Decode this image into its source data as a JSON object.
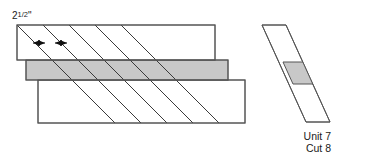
{
  "diagram": {
    "background_color": "#ffffff",
    "line_color": "#555555",
    "cut_line_color": "#3a3a3a",
    "fabric_gray": "#c8c8c8",
    "fabric_white": "#ffffff"
  },
  "dimension": {
    "whole": "2",
    "fraction": "1/2",
    "fraction_numerator": "1",
    "fraction_denominator": "2",
    "unit_mark": "\"",
    "full_label": "2 1/2\"",
    "description": "Width between adjacent diagonal cut lines"
  },
  "strip_assembly": {
    "name": "strip-set",
    "strip_count": 3,
    "strips": [
      {
        "index": 1,
        "position": "top",
        "fill": "#ffffff",
        "label": "top-white-strip",
        "x": 17,
        "y": 25,
        "width": 198,
        "height": 35
      },
      {
        "index": 2,
        "position": "middle",
        "fill": "#c8c8c8",
        "label": "middle-gray-strip",
        "x": 26,
        "y": 60,
        "width": 202,
        "height": 20
      },
      {
        "index": 3,
        "position": "bottom",
        "fill": "#ffffff",
        "label": "bottom-white-strip",
        "x": 38,
        "y": 80,
        "width": 207,
        "height": 43
      }
    ]
  },
  "cut_lines": {
    "count": 5,
    "angle_degrees": 45,
    "direction": "down-right",
    "spacing_label": "2 1/2\"",
    "offsets": [
      0,
      26,
      52,
      78,
      104
    ]
  },
  "cut_unit": {
    "name": "cut-unit-strip",
    "label_line1": "Unit 7",
    "label_line2": "Cut 8",
    "segments": [
      {
        "index": 1,
        "fill": "#ffffff",
        "name": "upper-white-segment"
      },
      {
        "index": 2,
        "fill": "#c8c8c8",
        "name": "middle-gray-segment"
      },
      {
        "index": 3,
        "fill": "#ffffff",
        "name": "lower-white-segment"
      }
    ]
  }
}
